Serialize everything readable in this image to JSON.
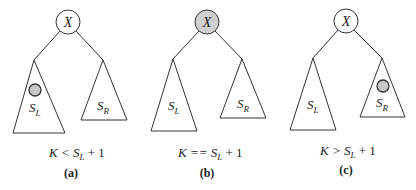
{
  "diagram": {
    "colors": {
      "stroke": "#333333",
      "highlight": "#d0d0d0"
    },
    "panels": [
      {
        "id": "a",
        "root_label": "X",
        "root_highlighted": false,
        "left_label": "S",
        "left_sub": "L",
        "right_label": "S",
        "right_sub": "R",
        "marker_in": "left",
        "condition_prefix": "K < S",
        "condition_sub": "L",
        "condition_suffix": " + 1",
        "caption": "(a)"
      },
      {
        "id": "b",
        "root_label": "X",
        "root_highlighted": true,
        "left_label": "S",
        "left_sub": "L",
        "right_label": "S",
        "right_sub": "R",
        "marker_in": "root",
        "condition_prefix": "K == S",
        "condition_sub": "L",
        "condition_suffix": " + 1",
        "caption": "(b)"
      },
      {
        "id": "c",
        "root_label": "X",
        "root_highlighted": false,
        "left_label": "S",
        "left_sub": "L",
        "right_label": "S",
        "right_sub": "R",
        "marker_in": "right",
        "condition_prefix": "K > S",
        "condition_sub": "L",
        "condition_suffix": " + 1",
        "caption": "(c)"
      }
    ]
  }
}
